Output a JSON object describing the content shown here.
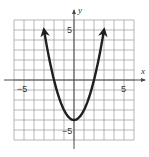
{
  "chart_data": {
    "type": "line",
    "title": "",
    "xlabel": "x",
    "ylabel": "y",
    "xlim": [
      -6,
      6
    ],
    "ylim": [
      -6,
      6
    ],
    "grid": true,
    "grid_step": 1,
    "legend": null,
    "x_tick_labels": [
      {
        "value": -5,
        "label": "−5"
      },
      {
        "value": 5,
        "label": "5"
      }
    ],
    "y_tick_labels": [
      {
        "value": 5,
        "label": "5"
      },
      {
        "value": -5,
        "label": "−5"
      }
    ],
    "series": [
      {
        "name": "parabola",
        "estimated_equation": "y = x^2 - 4",
        "vertex": [
          0,
          -4
        ],
        "x_intercepts": [
          -2,
          2
        ],
        "y_intercept": -4,
        "arrows_at_ends": true,
        "x": [
          -3.0,
          -2.5,
          -2.0,
          -1.5,
          -1.0,
          -0.5,
          0.0,
          0.5,
          1.0,
          1.5,
          2.0,
          2.5,
          3.0
        ],
        "y": [
          5.0,
          2.25,
          0.0,
          -1.75,
          -3.0,
          -3.75,
          -4.0,
          -3.75,
          -3.0,
          -1.75,
          0.0,
          2.25,
          5.0
        ],
        "color": "#1f1f1f"
      }
    ]
  },
  "labels": {
    "x_axis_name": "x",
    "y_axis_name": "y",
    "x_neg5": "−5",
    "x_pos5": "5",
    "y_pos5": "5",
    "y_neg5": "−5"
  }
}
